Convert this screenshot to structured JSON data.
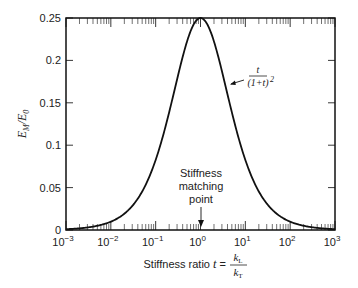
{
  "chart_data": {
    "type": "line",
    "title": "",
    "xlabel": "Stiffness ratio t = kL/kT",
    "xlabel_parts": {
      "prefix": "Stiffness ratio ",
      "var": "t",
      "eq": " = ",
      "num": "k",
      "num_sub": "L",
      "den": "k",
      "den_sub": "T"
    },
    "ylabel": "EM/E0",
    "ylabel_parts": {
      "main": "E",
      "sub1": "M",
      "slash": "/",
      "main2": "E",
      "sub2": "0"
    },
    "xscale": "log",
    "xlim": [
      0.001,
      1000
    ],
    "ylim": [
      0,
      0.25
    ],
    "x_ticks": [
      {
        "value": 0.001,
        "base": "10",
        "exp": "−3"
      },
      {
        "value": 0.01,
        "base": "10",
        "exp": "−2"
      },
      {
        "value": 0.1,
        "base": "10",
        "exp": "−1"
      },
      {
        "value": 1,
        "base": "10",
        "exp": "0"
      },
      {
        "value": 10,
        "base": "10",
        "exp": "1"
      },
      {
        "value": 100,
        "base": "10",
        "exp": "2"
      },
      {
        "value": 1000,
        "base": "10",
        "exp": "3"
      }
    ],
    "y_ticks": [
      {
        "value": 0,
        "label": "0"
      },
      {
        "value": 0.05,
        "label": "0.05"
      },
      {
        "value": 0.1,
        "label": "0.1"
      },
      {
        "value": 0.15,
        "label": "0.15"
      },
      {
        "value": 0.2,
        "label": "0.2"
      },
      {
        "value": 0.25,
        "label": "0.25"
      }
    ],
    "series": [
      {
        "name": "t/(1+t)^2",
        "formula": "t/(1+t)^2",
        "x": [
          0.001,
          0.003,
          0.01,
          0.03,
          0.1,
          0.3,
          1,
          3,
          10,
          30,
          100,
          300,
          1000
        ],
        "values": [
          0.001,
          0.003,
          0.0098,
          0.0275,
          0.0826,
          0.1775,
          0.25,
          0.1875,
          0.0826,
          0.0312,
          0.0098,
          0.0033,
          0.001
        ]
      }
    ],
    "annotations": [
      {
        "text": "t / (1+t)^2",
        "numerator": "t",
        "denominator": "(1+t)",
        "power": "2",
        "target_x": 4.5
      },
      {
        "text_lines": [
          "Stiffness",
          "matching",
          "point"
        ],
        "arrow_to_x": 1
      }
    ],
    "grid": false,
    "legend": "none"
  }
}
